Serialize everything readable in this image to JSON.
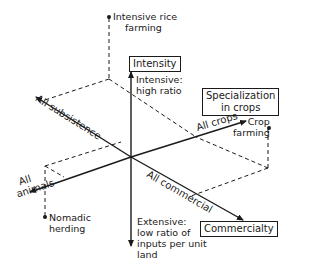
{
  "diagram": {
    "type": "3-axis agricultural classification diagram",
    "axes": {
      "vertical": {
        "title": "Intensity",
        "top_label": [
          "Intensive:",
          "high ratio"
        ],
        "bottom_label": [
          "Extensive:",
          "low ratio of",
          "inputs per unit",
          "land"
        ]
      },
      "subsistence_commercial": {
        "title": "Commercialty",
        "negative_end": "All subsistence",
        "positive_end": "All commercial"
      },
      "crops_animals": {
        "title": [
          "Specialization",
          "in crops"
        ],
        "positive_end": "All crops",
        "negative_end": [
          "All",
          "animals"
        ]
      }
    },
    "points": [
      {
        "label": [
          "Intensive rice",
          "farming"
        ]
      },
      {
        "label": [
          "Crop",
          "farming"
        ]
      },
      {
        "label": [
          "Nomadic",
          "herding"
        ]
      }
    ],
    "colors": {
      "ink": "#1a1a1a",
      "background": "#ffffff"
    }
  }
}
